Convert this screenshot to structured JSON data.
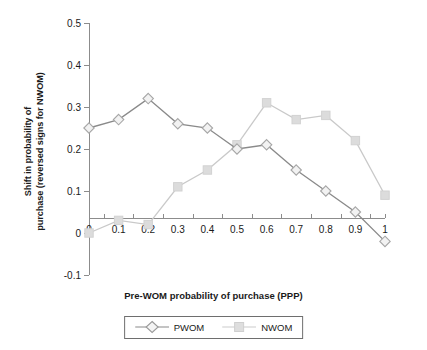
{
  "chart_data": {
    "type": "line",
    "title": "",
    "xlabel": "Pre-WOM probability of purchase (PPP)",
    "ylabel": "Shift in probability of purchase (reversed signs for NWOM)",
    "ylabel_line1": "Shift in probability of",
    "ylabel_line2": "purchase (reversed signs for NWOM)",
    "x": [
      0,
      0.1,
      0.2,
      0.3,
      0.4,
      0.5,
      0.6,
      0.7,
      0.8,
      0.9,
      1
    ],
    "xtick_labels": [
      "0",
      "0.1",
      "0.2",
      "0.3",
      "0.4",
      "0.5",
      "0.6",
      "0.7",
      "0.8",
      "0.9",
      "1"
    ],
    "ytick_labels": [
      "0.5",
      "0.4",
      "0.3",
      "0.2",
      "0.1",
      "0",
      "-0.1"
    ],
    "ytick_values": [
      0.5,
      0.4,
      0.3,
      0.2,
      0.1,
      0,
      -0.1
    ],
    "xlim": [
      0,
      1
    ],
    "ylim": [
      -0.1,
      0.5
    ],
    "grid": false,
    "legend_position": "bottom",
    "series": [
      {
        "name": "PWOM",
        "marker": "diamond",
        "color": "#8a8a8a",
        "marker_fill": "#f2f2f2",
        "values": [
          0.25,
          0.27,
          0.32,
          0.26,
          0.25,
          0.2,
          0.21,
          0.15,
          0.1,
          0.05,
          -0.02
        ]
      },
      {
        "name": "NWOM",
        "marker": "square",
        "color": "#c9c9c9",
        "marker_fill": "#dcdcdc",
        "values": [
          0.0,
          0.03,
          0.02,
          0.11,
          0.15,
          0.21,
          0.31,
          0.27,
          0.28,
          0.22,
          0.09
        ]
      }
    ]
  },
  "legend": {
    "items": [
      {
        "label": "PWOM"
      },
      {
        "label": "NWOM"
      }
    ]
  }
}
